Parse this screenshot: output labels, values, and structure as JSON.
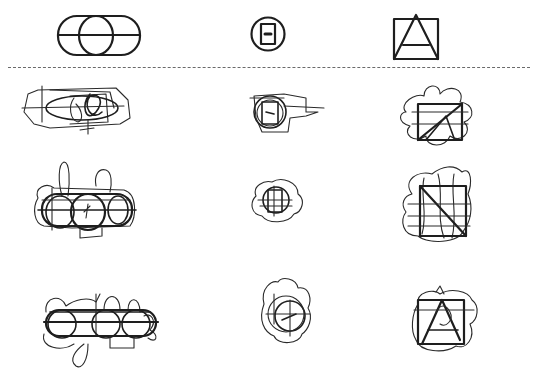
{
  "diagram": {
    "colors": {
      "ink": "#1e1e1e",
      "separator": "#6a6a6a",
      "background": "#ffffff"
    },
    "reference_figures": [
      {
        "name": "stadium-circle-line",
        "label": "rounded rectangle with inscribed circle and horizontal midline"
      },
      {
        "name": "circle-rect-dash",
        "label": "circle containing a small rectangle with a dash"
      },
      {
        "name": "square-triangle",
        "label": "square containing a triangle with crossbar"
      }
    ],
    "separator": "horizontal dashed divider",
    "rows": [
      {
        "row": 1,
        "cells": [
          "stadium scribble",
          "circle scribble",
          "square scribble"
        ]
      },
      {
        "row": 2,
        "cells": [
          "stadium scribble",
          "circle scribble",
          "square scribble"
        ]
      },
      {
        "row": 3,
        "cells": [
          "stadium scribble",
          "circle scribble",
          "square scribble"
        ]
      }
    ]
  }
}
